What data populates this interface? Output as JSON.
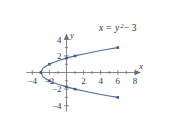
{
  "figure": {
    "name": "parabola-graph",
    "equation_label": {
      "lhs": "x",
      "equals": "=",
      "base": "y",
      "exponent": "2",
      "tail": "− 3",
      "full": "x = y² − 3"
    },
    "colors": {
      "curve": "#4a6aa8",
      "point": "#3c5a99",
      "axis": "#6b6b6b",
      "text": "#3a3a3a",
      "background": "#ffffff"
    }
  },
  "chart_data": {
    "type": "line",
    "title": "",
    "subtitle": "",
    "xlabel": "x",
    "ylabel": "y",
    "equation": "x = y^2 - 3",
    "grid": false,
    "legend": "none",
    "xlim": [
      -4.7,
      8.7
    ],
    "ylim": [
      -4.7,
      4.7
    ],
    "xticks": [
      -4,
      -2,
      2,
      4,
      6,
      8
    ],
    "yticks": [
      4,
      2,
      -2,
      -4
    ],
    "xtick_labels": [
      "−4",
      "−2",
      "2",
      "4",
      "6",
      "8"
    ],
    "ytick_labels": [
      "4",
      "2",
      "−2",
      "−4"
    ],
    "minor_xticks": [
      -3,
      -1,
      1,
      3,
      5,
      7
    ],
    "minor_yticks": [
      3,
      1,
      -1,
      -3
    ],
    "series": [
      {
        "name": "x = y^2 - 3",
        "x": [
          6.0,
          5.0,
          4.0,
          3.0,
          2.0,
          1.0,
          0.0,
          -1.0,
          -1.75,
          -2.0,
          -2.4375,
          -2.75,
          -3.0,
          -2.75,
          -2.4375,
          -2.0,
          -1.75,
          -1.0,
          0.0,
          1.0,
          2.0,
          3.0,
          4.0,
          5.0,
          6.0
        ],
        "y": [
          3.0,
          2.828,
          2.646,
          2.449,
          2.236,
          2.0,
          1.732,
          1.414,
          1.118,
          1.0,
          0.75,
          0.5,
          0.0,
          -0.5,
          -0.75,
          -1.0,
          -1.118,
          -1.414,
          -1.732,
          -2.0,
          -2.236,
          -2.449,
          -2.646,
          -2.828,
          -3.0
        ]
      }
    ],
    "marked_points": [
      {
        "x": -3,
        "y": 0,
        "label": "vertex"
      },
      {
        "x": -2,
        "y": 1,
        "label": ""
      },
      {
        "x": -2,
        "y": -1,
        "label": ""
      },
      {
        "x": 1,
        "y": 2,
        "label": ""
      },
      {
        "x": 1,
        "y": -2,
        "label": ""
      },
      {
        "x": 6,
        "y": 3,
        "label": ""
      },
      {
        "x": 6,
        "y": -3,
        "label": ""
      },
      {
        "x": 0,
        "y": 1.732,
        "label": ""
      },
      {
        "x": 0,
        "y": -1.732,
        "label": ""
      }
    ]
  }
}
